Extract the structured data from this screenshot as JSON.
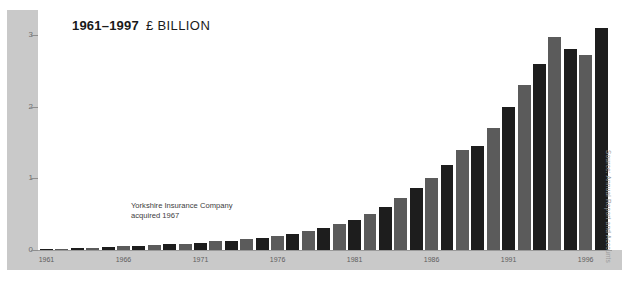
{
  "title": {
    "range": "1961–1997",
    "unit": "£ BILLION"
  },
  "annotation": {
    "line1": "Yorkshire Insurance Company",
    "line2": "acquired 1967"
  },
  "source_note": "Source: Annual Report and Accounts",
  "colors": {
    "bar_dark": "#1d1d1d",
    "bar_mid": "#5b5b5b",
    "panel": "#c9c9c9",
    "background": "#ffffff",
    "axis_text": "#5e5e5e"
  },
  "chart_data": {
    "type": "bar",
    "xlabel": "",
    "ylabel": "£ BILLION",
    "ylim": [
      0,
      3.35
    ],
    "yticks": [
      0,
      1,
      2,
      3
    ],
    "ytick_labels": [
      "0",
      "1",
      "2",
      "3"
    ],
    "grid": false,
    "legend": false,
    "xtick_labels": [
      "1961",
      "1966",
      "1971",
      "1976",
      "1981",
      "1986",
      "1991",
      "1996"
    ],
    "annotations": [
      "Yorkshire Insurance Company acquired 1967"
    ],
    "categories": [
      "1961",
      "1962",
      "1963",
      "1964",
      "1965",
      "1966",
      "1967",
      "1968",
      "1969",
      "1970",
      "1971",
      "1972",
      "1973",
      "1974",
      "1975",
      "1976",
      "1977",
      "1978",
      "1979",
      "1980",
      "1981",
      "1982",
      "1983",
      "1984",
      "1985",
      "1986",
      "1987",
      "1988",
      "1989",
      "1990",
      "1991",
      "1992",
      "1993",
      "1994",
      "1995",
      "1996",
      "1997"
    ],
    "values": [
      0.02,
      0.02,
      0.03,
      0.03,
      0.04,
      0.05,
      0.06,
      0.07,
      0.08,
      0.09,
      0.1,
      0.12,
      0.13,
      0.15,
      0.17,
      0.2,
      0.23,
      0.27,
      0.31,
      0.36,
      0.42,
      0.5,
      0.6,
      0.72,
      0.86,
      1.0,
      1.18,
      1.4,
      1.45,
      1.7,
      2.0,
      2.3,
      2.6,
      2.98,
      2.8,
      2.72,
      3.1
    ],
    "bar_shades": [
      "dark",
      "mid",
      "dark",
      "mid",
      "dark",
      "mid",
      "dark",
      "mid",
      "dark",
      "mid",
      "dark",
      "mid",
      "dark",
      "mid",
      "dark",
      "mid",
      "dark",
      "mid",
      "dark",
      "mid",
      "dark",
      "mid",
      "dark",
      "mid",
      "dark",
      "mid",
      "dark",
      "mid",
      "dark",
      "mid",
      "dark",
      "mid",
      "dark",
      "mid",
      "dark",
      "mid",
      "dark"
    ]
  }
}
